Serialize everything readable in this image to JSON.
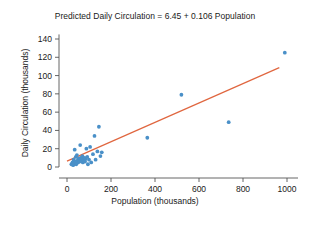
{
  "chart_data": {
    "type": "scatter",
    "title": "Predicted Daily Circulation = 6.45 + 0.106 Population",
    "xlabel": "Population (thousands)",
    "ylabel": "Daily Circulation (thousands)",
    "xlim": [
      0,
      1050
    ],
    "ylim": [
      0,
      145
    ],
    "xticks": [
      0,
      200,
      400,
      600,
      800,
      1000
    ],
    "yticks": [
      0,
      20,
      40,
      60,
      80,
      100,
      120,
      140
    ],
    "xtick_labels": [
      "0",
      "200",
      "400",
      "600",
      "800",
      "1000"
    ],
    "ytick_labels": [
      "0",
      "20",
      "40",
      "60",
      "80",
      "100",
      "120",
      "140"
    ],
    "grid": false,
    "legend": null,
    "marker_color": "#4a90c8",
    "line_color": "#e0663f",
    "series": [
      {
        "name": "Cities",
        "type": "scatter",
        "points": [
          [
            20,
            3
          ],
          [
            25,
            5
          ],
          [
            28,
            2
          ],
          [
            30,
            8
          ],
          [
            32,
            4
          ],
          [
            35,
            19
          ],
          [
            38,
            6
          ],
          [
            40,
            11
          ],
          [
            42,
            3
          ],
          [
            45,
            13
          ],
          [
            48,
            7
          ],
          [
            50,
            5
          ],
          [
            52,
            9
          ],
          [
            55,
            8
          ],
          [
            58,
            6
          ],
          [
            60,
            24
          ],
          [
            62,
            10
          ],
          [
            65,
            7
          ],
          [
            68,
            9
          ],
          [
            70,
            12
          ],
          [
            72,
            5
          ],
          [
            75,
            8
          ],
          [
            78,
            7
          ],
          [
            80,
            10
          ],
          [
            82,
            6
          ],
          [
            85,
            9
          ],
          [
            88,
            20
          ],
          [
            92,
            11
          ],
          [
            95,
            3
          ],
          [
            100,
            8
          ],
          [
            105,
            22
          ],
          [
            110,
            5
          ],
          [
            118,
            14
          ],
          [
            125,
            34
          ],
          [
            130,
            8
          ],
          [
            138,
            17
          ],
          [
            145,
            44
          ],
          [
            152,
            12
          ],
          [
            158,
            16
          ],
          [
            365,
            32
          ],
          [
            520,
            79
          ],
          [
            735,
            49
          ],
          [
            990,
            125
          ]
        ]
      },
      {
        "name": "Least-squares regression line",
        "type": "line",
        "equation": "Predicted Daily Circulation = 6.45 + 0.106 Population",
        "intercept": 6.45,
        "slope": 0.106,
        "x_range": [
          0,
          965
        ]
      }
    ]
  }
}
